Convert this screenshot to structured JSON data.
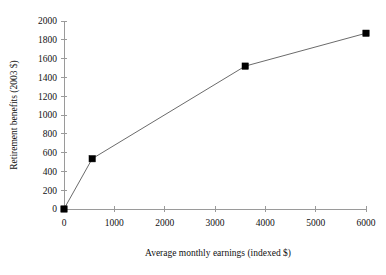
{
  "chart_data": {
    "type": "line",
    "title": "",
    "subtitle": "",
    "xlabel": "Average monthly earnings (indexed $)",
    "ylabel": "Retirement benefits (2003 $)",
    "xlim": [
      0,
      6000
    ],
    "ylim": [
      0,
      2000
    ],
    "xticks": [
      0,
      1000,
      2000,
      3000,
      4000,
      5000,
      6000
    ],
    "xtick_labels": [
      "0",
      "1000",
      "2000",
      "3000",
      "4000",
      "5000",
      "6000"
    ],
    "yticks": [
      0,
      200,
      400,
      600,
      800,
      1000,
      1200,
      1400,
      1600,
      1800,
      2000
    ],
    "ytick_labels": [
      "0",
      "200",
      "400",
      "600",
      "800",
      "1000",
      "1200",
      "1400",
      "1600",
      "1800",
      "2000"
    ],
    "grid": false,
    "legend": false,
    "legend_position": "none",
    "marker": "square",
    "marker_color": "#000000",
    "line_color": "#6b6b6b",
    "axis_color": "#9a9a9a",
    "series": [
      {
        "name": "Retirement benefits",
        "x": [
          0,
          560,
          3600,
          6000
        ],
        "y": [
          0,
          535,
          1520,
          1870
        ]
      }
    ],
    "points": [
      {
        "x": 0,
        "y": 0
      },
      {
        "x": 560,
        "y": 535
      },
      {
        "x": 3600,
        "y": 1520
      },
      {
        "x": 6000,
        "y": 1870
      }
    ]
  }
}
